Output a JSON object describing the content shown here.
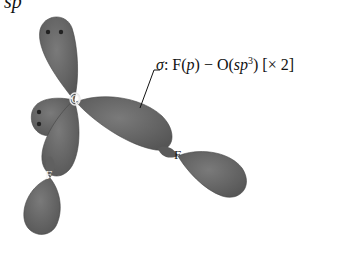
{
  "caption_fragment": "sp",
  "diagram": {
    "type": "orbital-overlap",
    "molecule": "OF2",
    "central_atom": "O",
    "terminal_atoms": [
      "F",
      "F"
    ],
    "lobe_color": "#6b6b6b",
    "lone_pair_lobes": 2,
    "bond_label": {
      "prefix": "σ: F(",
      "p": "p",
      "mid": ") − O(",
      "sp": "sp",
      "sup": "3",
      "suffix": ") [× 2]"
    },
    "atoms": {
      "center": "O",
      "f1": "F",
      "f2": "F"
    }
  }
}
